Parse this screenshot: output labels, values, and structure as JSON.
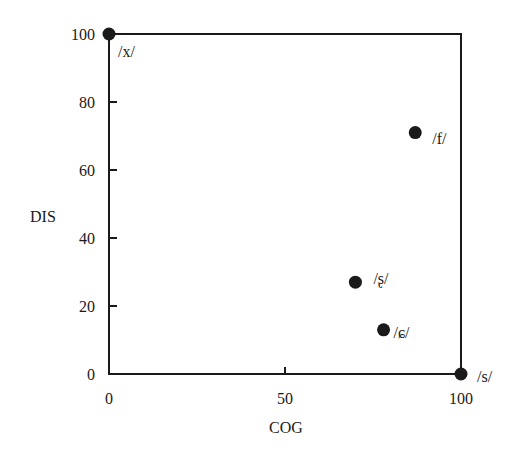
{
  "chart_data": {
    "type": "scatter",
    "title": "",
    "xlabel": "COG",
    "ylabel": "DIS",
    "xlim": [
      0,
      100
    ],
    "ylim": [
      0,
      100
    ],
    "xticks": [
      0,
      50,
      100
    ],
    "yticks": [
      0,
      20,
      40,
      60,
      80,
      100
    ],
    "grid": false,
    "legend": null,
    "points": [
      {
        "label": "/x/",
        "x": 0,
        "y": 100
      },
      {
        "label": "/f/",
        "x": 87,
        "y": 71
      },
      {
        "label": "/ʂ/",
        "x": 70,
        "y": 27
      },
      {
        "label": "/ɕ/",
        "x": 78,
        "y": 13
      },
      {
        "label": "/s/",
        "x": 100,
        "y": 0
      }
    ],
    "marker_color": "#1a1a1a"
  }
}
